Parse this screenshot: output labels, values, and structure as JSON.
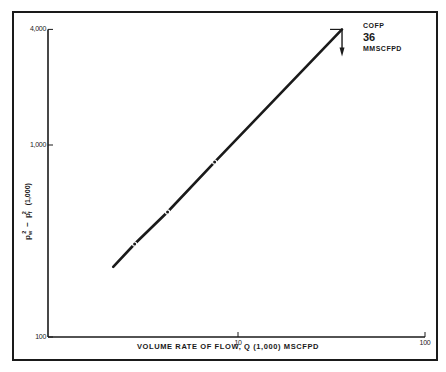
{
  "chart_data": {
    "type": "line",
    "title": "",
    "xlabel": "VOLUME RATE OF FLOW, Q (1,000) MSCFPD",
    "ylabel": "p_w² − p_f² (1,000)",
    "x_scale": "log",
    "y_scale": "log",
    "xlim": [
      1,
      100
    ],
    "ylim": [
      100,
      4000
    ],
    "x_ticks": [
      {
        "value": 10,
        "label": "10"
      },
      {
        "value": 100,
        "label": "100"
      }
    ],
    "y_ticks": [
      {
        "value": 100,
        "label": "100"
      },
      {
        "value": 1000,
        "label": "1,000"
      },
      {
        "value": 4000,
        "label": "4,000"
      }
    ],
    "grid": false,
    "legend": null,
    "series": [
      {
        "name": "Back-pressure test line",
        "x": [
          2.15,
          2.8,
          4.2,
          7.5,
          36
        ],
        "y": [
          232,
          305,
          448,
          815,
          4000
        ],
        "markers_at_index": [
          1,
          2,
          3
        ]
      }
    ],
    "annotations": [
      {
        "type": "arrow-label",
        "at": {
          "x": 36,
          "y": 4000
        },
        "lines": [
          "COFP",
          "36",
          "MMSCFPD"
        ]
      }
    ]
  },
  "labels": {
    "y_axis_main": "p",
    "y_axis_sub_w": "w",
    "y_axis_sub_f": "f",
    "y_axis_sup": "2",
    "y_axis_minus": "−",
    "y_axis_units": "(1,000)",
    "x_axis": "VOLUME RATE OF FLOW, Q (1,000) MSCFPD",
    "annot_line1": "COFP",
    "annot_line2": "36",
    "annot_line3": "MMSCFPD"
  },
  "colors": {
    "ink": "#1a1a1a",
    "background": "#ffffff"
  }
}
